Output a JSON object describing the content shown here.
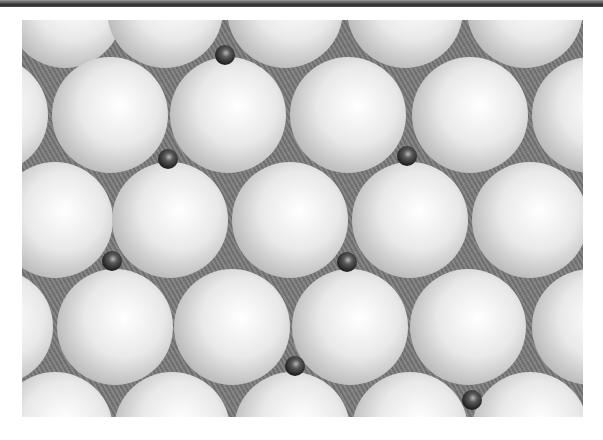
{
  "figure": {
    "colors": {
      "background": "#ffffff",
      "gap": "#7a7a7a",
      "large_sphere_highlight": "#ffffff",
      "large_sphere_shadow": "#b9b9b9",
      "small_atom_highlight": "#b8b8b8",
      "small_atom_shadow": "#1a1a1a"
    },
    "large_sphere_radius": 58,
    "small_atom_radius": 10,
    "large_spheres": [
      {
        "x": 65,
        "y": 10
      },
      {
        "x": 165,
        "y": 10
      },
      {
        "x": 285,
        "y": 10
      },
      {
        "x": 405,
        "y": 10
      },
      {
        "x": 525,
        "y": 10
      },
      {
        "x": -10,
        "y": 115
      },
      {
        "x": 110,
        "y": 115
      },
      {
        "x": 228,
        "y": 115
      },
      {
        "x": 348,
        "y": 115
      },
      {
        "x": 470,
        "y": 115
      },
      {
        "x": 590,
        "y": 115
      },
      {
        "x": 55,
        "y": 220
      },
      {
        "x": 170,
        "y": 220
      },
      {
        "x": 290,
        "y": 220
      },
      {
        "x": 410,
        "y": 220
      },
      {
        "x": 530,
        "y": 220
      },
      {
        "x": -5,
        "y": 327
      },
      {
        "x": 115,
        "y": 327
      },
      {
        "x": 232,
        "y": 327
      },
      {
        "x": 350,
        "y": 327
      },
      {
        "x": 468,
        "y": 327
      },
      {
        "x": 590,
        "y": 327
      },
      {
        "x": 55,
        "y": 430
      },
      {
        "x": 172,
        "y": 430
      },
      {
        "x": 292,
        "y": 430
      },
      {
        "x": 410,
        "y": 430
      },
      {
        "x": 530,
        "y": 430
      }
    ],
    "small_atoms": [
      {
        "x": 225,
        "y": 55
      },
      {
        "x": 168,
        "y": 159
      },
      {
        "x": 407,
        "y": 156
      },
      {
        "x": 112,
        "y": 261
      },
      {
        "x": 347,
        "y": 262
      },
      {
        "x": 295,
        "y": 366
      },
      {
        "x": 472,
        "y": 400
      }
    ]
  }
}
